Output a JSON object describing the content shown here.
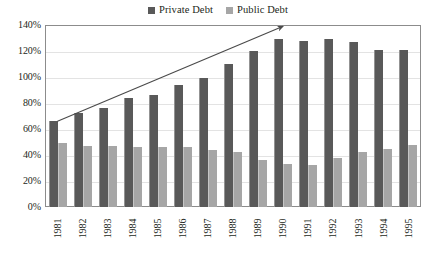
{
  "chart_data": {
    "type": "bar",
    "title": "",
    "subtitle": "",
    "xlabel": "",
    "ylabel": "",
    "ylim": [
      0,
      140
    ],
    "ytick_labels": [
      "0%",
      "20%",
      "40%",
      "60%",
      "80%",
      "100%",
      "120%",
      "140%"
    ],
    "ytick_values": [
      0,
      20,
      40,
      60,
      80,
      100,
      120,
      140
    ],
    "grid": true,
    "legend_position": "top-center",
    "categories": [
      "1981",
      "1982",
      "1983",
      "1984",
      "1985",
      "1986",
      "1987",
      "1988",
      "1989",
      "1990",
      "1991",
      "1992",
      "1993",
      "1994",
      "1995"
    ],
    "series": [
      {
        "name": "Private Debt",
        "color": "#595959",
        "values": [
          66,
          72,
          76,
          84,
          86,
          94,
          99,
          110,
          120,
          129,
          128,
          129,
          127,
          121,
          121
        ]
      },
      {
        "name": "Public Debt",
        "color": "#a6a6a6",
        "values": [
          49,
          47,
          47,
          46,
          46,
          46,
          44,
          42,
          36,
          33,
          32,
          38,
          42,
          45,
          48
        ]
      }
    ],
    "annotations": [
      {
        "name": "upward-trend-arrow",
        "type": "arrow",
        "from": {
          "x": "1981",
          "y": 66
        },
        "to": {
          "x": "1990",
          "y": 139
        },
        "color": "#4a4a4a"
      }
    ]
  },
  "legend": {
    "entries": [
      {
        "label": "Private Debt",
        "color": "#595959",
        "icon": "square-swatch-icon"
      },
      {
        "label": "Public Debt",
        "color": "#a6a6a6",
        "icon": "square-swatch-icon"
      }
    ]
  },
  "colors": {
    "private_debt": "#595959",
    "public_debt": "#a6a6a6",
    "plot_border": "#8c8c8c",
    "gridline": "#e3e3e3",
    "arrow": "#4a4a4a",
    "text": "#231f20",
    "background": "#ffffff"
  }
}
